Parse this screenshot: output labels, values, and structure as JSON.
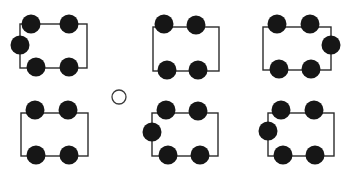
{
  "figure": {
    "title": "",
    "canvas": {
      "width": 351,
      "height": 170,
      "background": "#ffffff"
    },
    "style": {
      "rect_stroke_color": "#2b2b2b",
      "rect_stroke_width": 1.4,
      "rect_fill": "none",
      "filled_node_color": "#161616",
      "hollow_node_stroke_color": "#3a3a3a",
      "hollow_node_fill": "#ffffff",
      "hollow_node_stroke_width": 1.3,
      "node_radius": 9.5,
      "hollow_node_radius": 7
    },
    "groups": [
      {
        "id": "group-1",
        "name": "top-left-rectangle-group",
        "row": "top",
        "column": "left",
        "node_count": 5,
        "rect": {
          "x": 20,
          "y": 24,
          "width": 67,
          "height": 44
        },
        "nodes": [
          {
            "name": "node-top-left",
            "position": "top-left-corner",
            "cx": 31,
            "cy": 24,
            "type": "filled"
          },
          {
            "name": "node-top-right",
            "position": "top-right-corner",
            "cx": 69,
            "cy": 24,
            "type": "filled"
          },
          {
            "name": "node-bottom-left",
            "position": "bottom-left-corner",
            "cx": 36,
            "cy": 67,
            "type": "filled"
          },
          {
            "name": "node-bottom-right",
            "position": "bottom-right-corner",
            "cx": 69,
            "cy": 67,
            "type": "filled"
          },
          {
            "name": "node-left-edge",
            "position": "left-edge-middle",
            "cx": 20,
            "cy": 45,
            "type": "filled"
          }
        ]
      },
      {
        "id": "group-2",
        "name": "top-middle-rectangle-group",
        "row": "top",
        "column": "middle",
        "node_count": 4,
        "rect": {
          "x": 153,
          "y": 27,
          "width": 66,
          "height": 44
        },
        "nodes": [
          {
            "name": "node-top-left",
            "position": "top-left-corner",
            "cx": 164,
            "cy": 24,
            "type": "filled"
          },
          {
            "name": "node-top-right",
            "position": "top-right-corner",
            "cx": 196,
            "cy": 25,
            "type": "filled"
          },
          {
            "name": "node-bottom-left",
            "position": "bottom-left-corner",
            "cx": 167,
            "cy": 70,
            "type": "filled"
          },
          {
            "name": "node-bottom-right",
            "position": "bottom-right-corner",
            "cx": 198,
            "cy": 70,
            "type": "filled"
          }
        ]
      },
      {
        "id": "group-3",
        "name": "top-right-rectangle-group",
        "row": "top",
        "column": "right",
        "node_count": 5,
        "rect": {
          "x": 263,
          "y": 27,
          "width": 68,
          "height": 43
        },
        "nodes": [
          {
            "name": "node-top-left",
            "position": "top-left-corner",
            "cx": 277,
            "cy": 24,
            "type": "filled"
          },
          {
            "name": "node-top-right",
            "position": "top-right-corner",
            "cx": 310,
            "cy": 24,
            "type": "filled"
          },
          {
            "name": "node-bottom-left",
            "position": "bottom-left-corner",
            "cx": 279,
            "cy": 69,
            "type": "filled"
          },
          {
            "name": "node-bottom-right",
            "position": "bottom-right-corner",
            "cx": 311,
            "cy": 69,
            "type": "filled"
          },
          {
            "name": "node-right-edge",
            "position": "right-edge-middle",
            "cx": 331,
            "cy": 45,
            "type": "filled"
          }
        ]
      },
      {
        "id": "group-4",
        "name": "bottom-left-rectangle-group",
        "row": "bottom",
        "column": "left",
        "node_count": 4,
        "rect": {
          "x": 21,
          "y": 113,
          "width": 67,
          "height": 43
        },
        "nodes": [
          {
            "name": "node-top-left",
            "position": "top-left-corner",
            "cx": 35,
            "cy": 110,
            "type": "filled"
          },
          {
            "name": "node-top-right",
            "position": "top-right-corner",
            "cx": 68,
            "cy": 110,
            "type": "filled"
          },
          {
            "name": "node-bottom-left",
            "position": "bottom-left-corner",
            "cx": 36,
            "cy": 155,
            "type": "filled"
          },
          {
            "name": "node-bottom-right",
            "position": "bottom-right-corner",
            "cx": 69,
            "cy": 155,
            "type": "filled"
          }
        ]
      },
      {
        "id": "group-5",
        "name": "bottom-middle-rectangle-group",
        "row": "bottom",
        "column": "middle",
        "node_count": 5,
        "rect": {
          "x": 152,
          "y": 113,
          "width": 66,
          "height": 43
        },
        "nodes": [
          {
            "name": "node-top-left",
            "position": "top-left-corner",
            "cx": 166,
            "cy": 110,
            "type": "filled"
          },
          {
            "name": "node-top-right",
            "position": "top-right-corner",
            "cx": 198,
            "cy": 111,
            "type": "filled"
          },
          {
            "name": "node-bottom-left",
            "position": "bottom-left-corner",
            "cx": 168,
            "cy": 155,
            "type": "filled"
          },
          {
            "name": "node-bottom-right",
            "position": "bottom-right-corner",
            "cx": 200,
            "cy": 155,
            "type": "filled"
          },
          {
            "name": "node-left-edge",
            "position": "left-edge-middle",
            "cx": 152,
            "cy": 132,
            "type": "filled"
          }
        ]
      },
      {
        "id": "group-6",
        "name": "bottom-right-rectangle-group",
        "row": "bottom",
        "column": "right",
        "node_count": 5,
        "rect": {
          "x": 268,
          "y": 113,
          "width": 66,
          "height": 43
        },
        "nodes": [
          {
            "name": "node-top-left",
            "position": "top-left-corner",
            "cx": 281,
            "cy": 110,
            "type": "filled"
          },
          {
            "name": "node-top-right",
            "position": "top-right-corner",
            "cx": 314,
            "cy": 110,
            "type": "filled"
          },
          {
            "name": "node-bottom-left",
            "position": "bottom-left-corner",
            "cx": 283,
            "cy": 155,
            "type": "filled"
          },
          {
            "name": "node-bottom-right",
            "position": "bottom-right-corner",
            "cx": 315,
            "cy": 155,
            "type": "filled"
          },
          {
            "name": "node-left-edge",
            "position": "left-edge-middle",
            "cx": 268,
            "cy": 131,
            "type": "filled"
          }
        ]
      }
    ],
    "standalone_nodes": [
      {
        "id": "center-hollow-circle",
        "name": "center-hollow-node",
        "position": "center-between-rows",
        "cx": 119,
        "cy": 97,
        "type": "hollow"
      }
    ]
  }
}
